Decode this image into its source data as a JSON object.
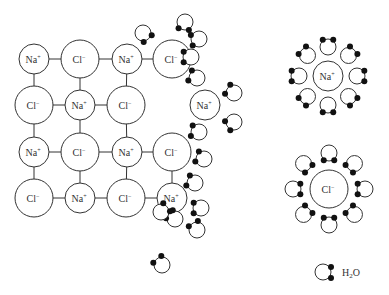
{
  "diagram": {
    "colors": {
      "stroke": "#333333",
      "hydrogen": "#111111",
      "background": "#ffffff"
    },
    "labels": {
      "na": "Na",
      "na_charge": "+",
      "cl": "Cl",
      "cl_charge": "−"
    },
    "lattice": {
      "ions": [
        {
          "type": "na",
          "x": 34,
          "y": 59
        },
        {
          "type": "cl",
          "x": 80,
          "y": 59
        },
        {
          "type": "na",
          "x": 127,
          "y": 59
        },
        {
          "type": "cl",
          "x": 172,
          "y": 59
        },
        {
          "type": "cl",
          "x": 34,
          "y": 105
        },
        {
          "type": "na",
          "x": 80,
          "y": 105
        },
        {
          "type": "cl",
          "x": 126,
          "y": 105
        },
        {
          "type": "na",
          "x": 34,
          "y": 152
        },
        {
          "type": "cl",
          "x": 80,
          "y": 152
        },
        {
          "type": "na",
          "x": 127,
          "y": 152
        },
        {
          "type": "cl",
          "x": 172,
          "y": 152
        },
        {
          "type": "cl",
          "x": 34,
          "y": 198
        },
        {
          "type": "na",
          "x": 80,
          "y": 198
        },
        {
          "type": "cl",
          "x": 126,
          "y": 198
        },
        {
          "type": "na",
          "x": 172,
          "y": 198
        }
      ],
      "detaching_ion": {
        "type": "na",
        "x": 205,
        "y": 105
      }
    },
    "hydrated_na": {
      "x": 328,
      "y": 76
    },
    "hydrated_cl": {
      "x": 329,
      "y": 189
    },
    "legend": {
      "label": "H",
      "sub": "2",
      "suffix": "O"
    }
  }
}
